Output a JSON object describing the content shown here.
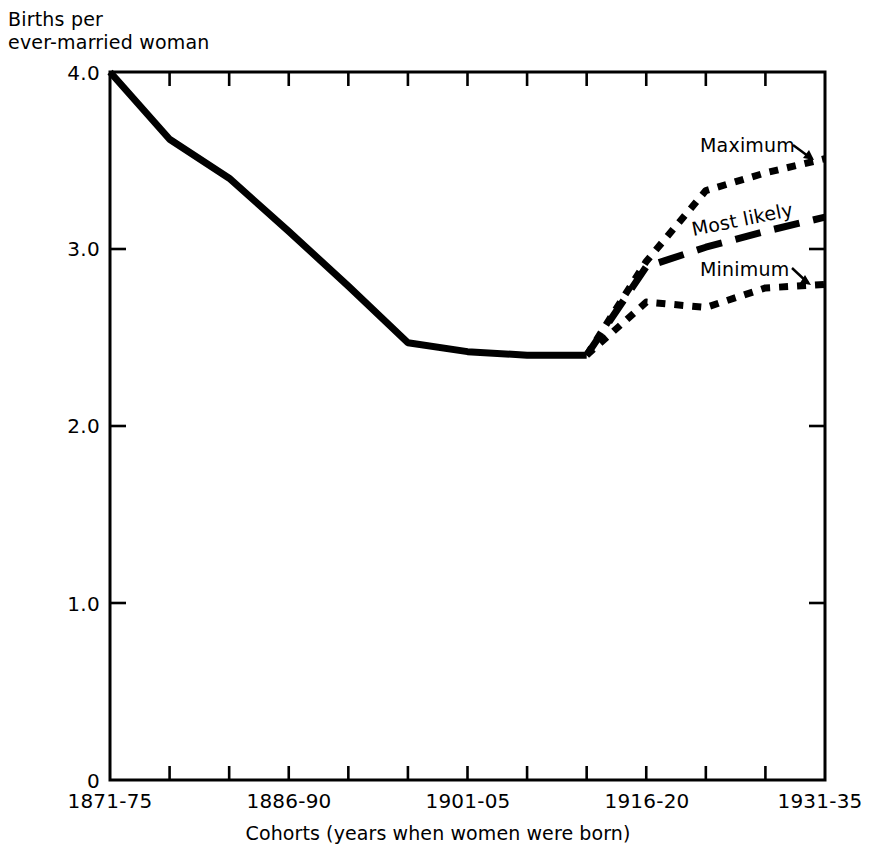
{
  "chart_data": {
    "type": "line",
    "title": "",
    "ylabel": "Births per\never-married woman",
    "xlabel": "Cohorts (years when women were born)",
    "ylim": [
      0,
      4.0
    ],
    "ytick_values": [
      0,
      1.0,
      2.0,
      3.0,
      4.0
    ],
    "ytick_labels": [
      "0",
      "1.0",
      "2.0",
      "3.0",
      "4.0"
    ],
    "grid": false,
    "legend_position": "inline-annotations",
    "categories": [
      "1871-75",
      "1876-80",
      "1881-85",
      "1886-90",
      "1891-95",
      "1896-1900",
      "1901-05",
      "1906-10",
      "1911-15",
      "1916-20",
      "1921-25",
      "1926-30",
      "1931-35"
    ],
    "xtick_labels_shown": [
      "1871-75",
      "1886-90",
      "1901-05",
      "1916-20",
      "1931-35"
    ],
    "xtick_label_indices": [
      0,
      3,
      6,
      9,
      12
    ],
    "n_xticks": 13,
    "series": [
      {
        "name": "Actual",
        "style": "solid",
        "x": [
          "1871-75",
          "1876-80",
          "1881-85",
          "1886-90",
          "1891-95",
          "1896-1900",
          "1901-05",
          "1906-10",
          "1911-15"
        ],
        "values": [
          4.0,
          3.62,
          3.4,
          3.1,
          2.79,
          2.47,
          2.42,
          2.4,
          2.4
        ]
      },
      {
        "name": "Maximum",
        "style": "dotted",
        "x": [
          "1911-15",
          "1916-20",
          "1921-25",
          "1926-30",
          "1931-35"
        ],
        "values": [
          2.4,
          2.93,
          3.33,
          3.43,
          3.51
        ]
      },
      {
        "name": "Most likely",
        "style": "dashed",
        "x": [
          "1911-15",
          "1916-20",
          "1921-25",
          "1926-30",
          "1931-35"
        ],
        "values": [
          2.4,
          2.9,
          3.01,
          3.1,
          3.18
        ]
      },
      {
        "name": "Minimum",
        "style": "dotted",
        "x": [
          "1911-15",
          "1916-20",
          "1921-25",
          "1926-30",
          "1931-35"
        ],
        "values": [
          2.4,
          2.7,
          2.67,
          2.78,
          2.8
        ]
      }
    ],
    "annotations": [
      {
        "text": "Maximum",
        "has_arrow": true
      },
      {
        "text": "Most likely",
        "has_arrow": false
      },
      {
        "text": "Minimum",
        "has_arrow": true
      }
    ],
    "colors": {
      "line": "#000000",
      "axis": "#000000",
      "background": "#ffffff"
    }
  }
}
